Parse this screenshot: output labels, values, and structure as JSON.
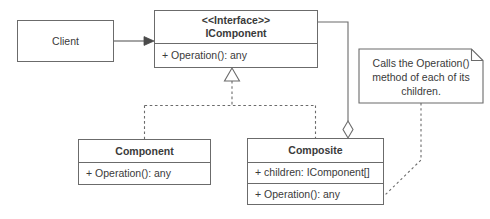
{
  "diagram": {
    "stroke_color": "#6b6b6b",
    "text_color": "#3a3a3a",
    "background_color": "#ffffff"
  },
  "nodes": {
    "client": {
      "name": "Client"
    },
    "icomponent": {
      "stereotype": "<<Interface>>",
      "name": "IComponent",
      "operations": [
        "+ Operation(): any"
      ]
    },
    "component": {
      "name": "Component",
      "operations": [
        "+ Operation(): any"
      ]
    },
    "composite": {
      "name": "Composite",
      "attributes": [
        "+ children: IComponent[]"
      ],
      "operations": [
        "+ Operation(): any"
      ]
    }
  },
  "note": {
    "lines": [
      "Calls the Operation()",
      "method of each of its",
      "children."
    ]
  },
  "edges": [
    {
      "id": "client-uses-icomponent",
      "type": "association",
      "style": "solid",
      "arrow": "open-arrow",
      "from": "client",
      "to": "icomponent"
    },
    {
      "id": "component-realizes-icomponent",
      "type": "realization",
      "style": "dashed",
      "arrow": "hollow-triangle",
      "from": "component",
      "to": "icomponent"
    },
    {
      "id": "composite-realizes-icomponent",
      "type": "realization",
      "style": "dashed",
      "arrow": "hollow-triangle",
      "from": "composite",
      "to": "icomponent"
    },
    {
      "id": "composite-aggregates-icomponent",
      "type": "aggregation",
      "style": "solid",
      "arrow": "hollow-diamond",
      "from": "icomponent",
      "to": "composite"
    },
    {
      "id": "note-anchor-composite-operation",
      "type": "note-anchor",
      "style": "dotted",
      "arrow": "none",
      "from": "note",
      "to": "composite"
    }
  ]
}
